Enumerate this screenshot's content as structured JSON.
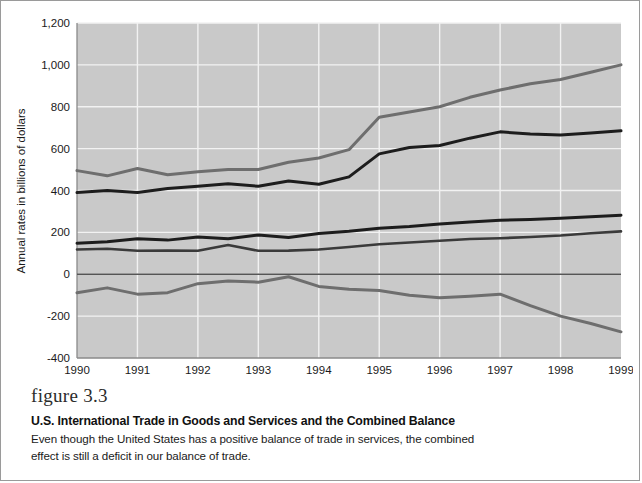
{
  "figure": {
    "number_label": "figure 3.3",
    "title": "U.S. International Trade in Goods and Services and the Combined Balance",
    "body": "Even though the United States has a positive balance of trade in services, the combined effect is still a deficit in our balance of trade."
  },
  "colors": {
    "plot_background": "#c9c9c9",
    "grid": "#f2f2f2",
    "goods_imports": "#6e6e6e",
    "goods_exports": "#1d1d1d",
    "services_exports": "#1d1d1d",
    "services_imports": "#3a3a3a",
    "combined_balance": "#6e6e6e",
    "frame": "#9a9a9a"
  },
  "annotations": [
    {
      "label": "Goods imports",
      "x": 0.9,
      "y": 640
    },
    {
      "label": "Goods exports",
      "x": 1.0,
      "y": 300
    },
    {
      "label": "Services exports",
      "x": 4.0,
      "y": 240
    },
    {
      "label": "Services imports",
      "x": 4.1,
      "y": 95
    },
    {
      "label": "Combined balance",
      "x": 0.95,
      "y": -135
    }
  ],
  "chart_data": {
    "type": "line",
    "title": "U.S. International Trade in Goods and Services and the Combined Balance",
    "xlabel": "",
    "ylabel": "Annual rates in billions of dollars",
    "x": [
      1990,
      1990.5,
      1991,
      1991.5,
      1992,
      1992.5,
      1993,
      1993.5,
      1994,
      1994.5,
      1995,
      1995.5,
      1996,
      1996.5,
      1997,
      1997.5,
      1998,
      1998.5,
      1999
    ],
    "xlim": [
      1990,
      1999
    ],
    "ylim": [
      -400,
      1200
    ],
    "yticks": [
      -400,
      -200,
      0,
      200,
      400,
      600,
      800,
      1000,
      1200
    ],
    "ytick_labels": [
      "-400",
      "-200",
      "0",
      "200",
      "400",
      "600",
      "800",
      "1,000",
      "1,200"
    ],
    "xticks": [
      1990,
      1991,
      1992,
      1993,
      1994,
      1995,
      1996,
      1997,
      1998,
      1999
    ],
    "xtick_labels": [
      "1990",
      "1991",
      "1992",
      "1993",
      "1994",
      "1995",
      "1996",
      "1997",
      "1998",
      "1999"
    ],
    "grid": true,
    "legend": "annotated-inline",
    "series": [
      {
        "name": "Goods imports",
        "color": "#6e6e6e",
        "style": "gray",
        "values": [
          495,
          470,
          505,
          475,
          490,
          500,
          500,
          535,
          555,
          595,
          750,
          775,
          800,
          845,
          880,
          910,
          930,
          965,
          1000
        ]
      },
      {
        "name": "Goods exports",
        "color": "#1d1d1d",
        "style": "dark",
        "values": [
          390,
          400,
          390,
          410,
          420,
          432,
          420,
          445,
          430,
          465,
          575,
          605,
          615,
          650,
          680,
          670,
          665,
          675,
          685
        ]
      },
      {
        "name": "Services exports",
        "color": "#1d1d1d",
        "style": "dark",
        "values": [
          148,
          155,
          170,
          163,
          178,
          170,
          188,
          175,
          195,
          205,
          220,
          228,
          240,
          250,
          258,
          262,
          268,
          275,
          282
        ]
      },
      {
        "name": "Services imports",
        "color": "#3a3a3a",
        "style": "mid",
        "values": [
          118,
          122,
          112,
          113,
          112,
          140,
          112,
          113,
          118,
          130,
          143,
          152,
          160,
          168,
          172,
          178,
          185,
          196,
          205
        ]
      },
      {
        "name": "Combined balance",
        "color": "#6e6e6e",
        "style": "gray",
        "values": [
          -88,
          -65,
          -95,
          -88,
          -45,
          -32,
          -38,
          -12,
          -58,
          -72,
          -78,
          -100,
          -112,
          -105,
          -95,
          -150,
          -200,
          -235,
          -275
        ]
      }
    ]
  }
}
